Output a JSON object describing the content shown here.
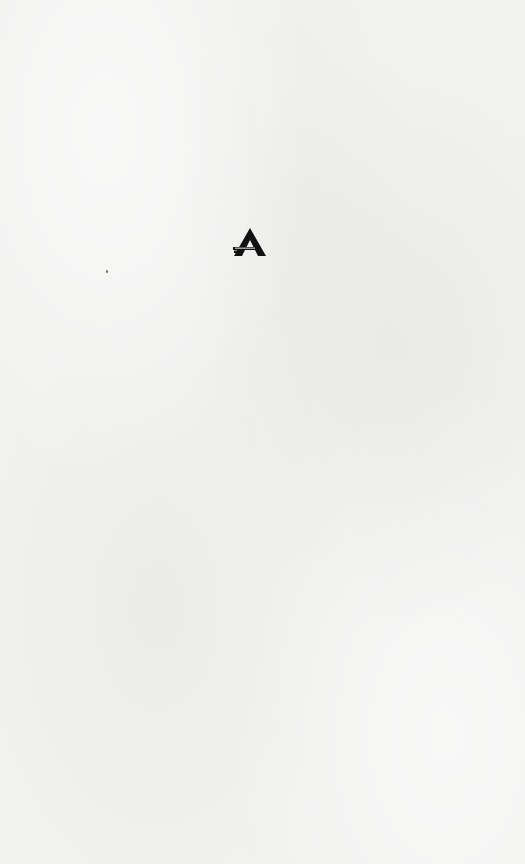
{
  "page": {
    "background_color": "#f1f1f0",
    "style": "paper-textured blank page"
  },
  "logo": {
    "icon": "triangle-a-logo-icon",
    "glyph": "A",
    "color": "#111111",
    "bar_color": "#111111",
    "wordmark": ""
  }
}
